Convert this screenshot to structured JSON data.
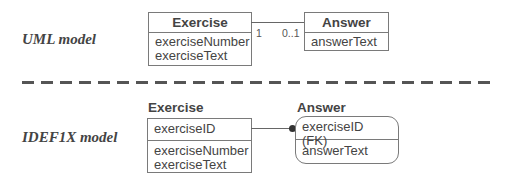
{
  "uml": {
    "label": "UML model",
    "exercise": {
      "name": "Exercise",
      "attributes": [
        "exerciseNumber",
        "exerciseText"
      ]
    },
    "answer": {
      "name": "Answer",
      "attributes": [
        "answerText"
      ]
    },
    "association": {
      "exercise_end_multiplicity": "1",
      "answer_end_multiplicity": "0..1"
    }
  },
  "separator": {
    "style": "dashed"
  },
  "idef1x": {
    "label": "IDEF1X model",
    "exercise": {
      "name": "Exercise",
      "key_attributes": [
        "exerciseID"
      ],
      "attributes": [
        "exerciseNumber",
        "exerciseText"
      ]
    },
    "answer": {
      "name": "Answer",
      "key_attributes": [
        "exerciseID (FK)"
      ],
      "attributes": [
        "answerText"
      ]
    }
  }
}
